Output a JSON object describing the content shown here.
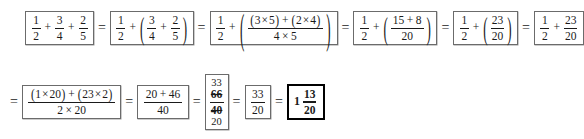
{
  "document": {
    "type": "math-worksheet-solution",
    "topic": "Addition of three fractions, step by step",
    "background_color": "#ffffff",
    "text_color": "#1a1a1a",
    "box_border_color": "#6b6b6b",
    "answer_border_color": "#000000"
  },
  "symbols": {
    "equals": "=",
    "plus": "+",
    "times": "×",
    "lparen": "(",
    "rparen": ")"
  },
  "row1": {
    "steps": [
      {
        "id": "step-1",
        "label": "original-expression",
        "fractions": [
          {
            "num": "1",
            "den": "2"
          },
          {
            "num": "3",
            "den": "4"
          },
          {
            "num": "2",
            "den": "5"
          }
        ]
      },
      {
        "id": "step-2",
        "label": "grouped-last-two",
        "first": {
          "num": "1",
          "den": "2"
        },
        "group": [
          {
            "num": "3",
            "den": "4"
          },
          {
            "num": "2",
            "den": "5"
          }
        ]
      },
      {
        "id": "step-3",
        "label": "cross-multiply-group",
        "first": {
          "num": "1",
          "den": "2"
        },
        "group_fraction": {
          "num_left_a": "3",
          "num_left_b": "5",
          "num_right_a": "2",
          "num_right_b": "4",
          "den_a": "4",
          "den_b": "5"
        }
      },
      {
        "id": "step-4",
        "label": "evaluate-products",
        "first": {
          "num": "1",
          "den": "2"
        },
        "group_fraction": {
          "num_a": "15",
          "num_b": "8",
          "den": "20"
        }
      },
      {
        "id": "step-5",
        "label": "sum-in-parentheses",
        "first": {
          "num": "1",
          "den": "2"
        },
        "group_fraction": {
          "num": "23",
          "den": "20"
        }
      },
      {
        "id": "step-6",
        "label": "drop-parentheses",
        "fractions": [
          {
            "num": "1",
            "den": "2"
          },
          {
            "num": "23",
            "den": "20"
          }
        ]
      }
    ]
  },
  "row2": {
    "steps": [
      {
        "id": "step-7",
        "label": "cross-multiply-final",
        "fraction": {
          "num_left_a": "1",
          "num_left_b": "20",
          "num_right_a": "23",
          "num_right_b": "2",
          "den_a": "2",
          "den_b": "20"
        }
      },
      {
        "id": "step-8",
        "label": "evaluate-products-final",
        "fraction": {
          "num_a": "20",
          "num_b": "46",
          "den": "40"
        }
      },
      {
        "id": "step-9",
        "label": "reduce-by-cancelling",
        "cancel": {
          "num_reduced": "33",
          "num_original": "66",
          "den_original": "40",
          "den_reduced": "20"
        }
      },
      {
        "id": "step-10",
        "label": "reduced-improper-fraction",
        "fraction": {
          "num": "33",
          "den": "20"
        }
      },
      {
        "id": "step-11",
        "label": "final-answer-mixed-number",
        "mixed": {
          "whole": "1",
          "num": "13",
          "den": "20"
        }
      }
    ]
  }
}
